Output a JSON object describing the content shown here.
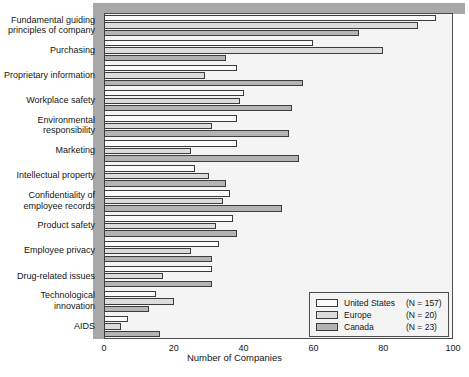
{
  "chart_data": {
    "type": "bar",
    "orientation": "horizontal",
    "title": "",
    "xlabel": "Number of Companies",
    "ylabel": "",
    "xlim": [
      0,
      100
    ],
    "xticks": [
      0,
      20,
      40,
      60,
      80,
      100
    ],
    "grid": false,
    "legend_position": "bottom-right",
    "categories": [
      "Fundamental guiding\nprinciples of company",
      "Purchasing",
      "Proprietary information",
      "Workplace safety",
      "Environmental\nresponsibility",
      "Marketing",
      "Intellectual property",
      "Confidentiality of\nemployee records",
      "Product safety",
      "Employee privacy",
      "Drug-related issues",
      "Technological\ninnovation",
      "AIDS"
    ],
    "series": [
      {
        "name": "United States",
        "n_label": "(N = 157)",
        "color": "#fbfbfb",
        "values": [
          95,
          60,
          38,
          40,
          38,
          38,
          26,
          36,
          37,
          33,
          31,
          15,
          7
        ]
      },
      {
        "name": "Europe",
        "n_label": "(N = 20)",
        "color": "#dcdcdc",
        "values": [
          90,
          80,
          29,
          39,
          31,
          25,
          30,
          34,
          32,
          25,
          17,
          20,
          5
        ]
      },
      {
        "name": "Canada",
        "n_label": "(N = 23)",
        "color": "#b4b4b4",
        "values": [
          73,
          35,
          57,
          54,
          53,
          56,
          35,
          51,
          38,
          31,
          31,
          13,
          16
        ]
      }
    ]
  },
  "legend": {
    "entries": [
      {
        "label": "United States",
        "n": "(N = 157)",
        "swatch": "us"
      },
      {
        "label": "Europe",
        "n": "(N = 20)",
        "swatch": "europe"
      },
      {
        "label": "Canada",
        "n": "(N = 23)",
        "swatch": "canada"
      }
    ]
  },
  "axis": {
    "x_title": "Number of Companies",
    "x_tick_labels": [
      "0",
      "20",
      "40",
      "60",
      "80",
      "100"
    ]
  },
  "background_text": {
    "lines": [
      "Getting Caught in t",
      "responsibil"
    ]
  }
}
